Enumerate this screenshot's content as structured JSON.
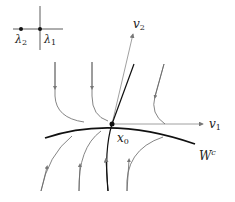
{
  "inset": {
    "labels": {
      "lambda2": "λ",
      "lambda2_sub": "2",
      "lambda1": "λ",
      "lambda1_sub": "1"
    }
  },
  "axes": {
    "v1": {
      "label": "v",
      "sub": "1"
    },
    "v2": {
      "label": "v",
      "sub": "2"
    }
  },
  "point": {
    "label": "x",
    "sub": "0"
  },
  "manifold": {
    "label": "W",
    "sup": "c"
  },
  "colors": {
    "ink": "#111111",
    "flow": "#666666",
    "axis": "#888888"
  }
}
